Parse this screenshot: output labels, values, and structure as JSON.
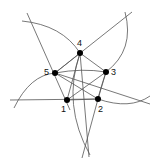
{
  "diagram": {
    "title": "",
    "nodes": [
      {
        "id": "1",
        "label": "1",
        "x": 67,
        "y": 100,
        "lx": 60,
        "ly": 112
      },
      {
        "id": "2",
        "label": "2",
        "x": 98,
        "y": 99,
        "lx": 99,
        "ly": 112
      },
      {
        "id": "3",
        "label": "3",
        "x": 106,
        "y": 72,
        "lx": 112,
        "ly": 75
      },
      {
        "id": "4",
        "label": "4",
        "x": 80,
        "y": 53,
        "lx": 77,
        "ly": 46
      },
      {
        "id": "5",
        "label": "5",
        "x": 55,
        "y": 73,
        "lx": 44,
        "ly": 75
      }
    ],
    "colors": {
      "stroke": "#444444",
      "node": "#000000",
      "background": "#ffffff"
    }
  }
}
